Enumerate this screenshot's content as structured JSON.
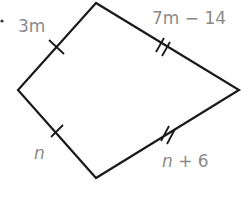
{
  "figure": {
    "type": "kite",
    "vertices": {
      "top": [
        96,
        3
      ],
      "left": [
        18,
        90
      ],
      "bottom": [
        96,
        178
      ],
      "right": [
        239,
        90
      ]
    },
    "sides": [
      {
        "id": "top-left",
        "label_var": "3m",
        "label_rest": "",
        "tick_marks": 1
      },
      {
        "id": "top-right",
        "label_var": "7m",
        "label_rest": " − 14",
        "tick_marks": 2
      },
      {
        "id": "bottom-left",
        "label_var": "n",
        "label_rest": "",
        "tick_marks": 1
      },
      {
        "id": "bottom-right",
        "label_var": "n",
        "label_rest": " + 6",
        "tick_marks": 2
      }
    ],
    "colors": {
      "stroke": "#1a1a1a",
      "label": "#8a8a8a"
    }
  }
}
